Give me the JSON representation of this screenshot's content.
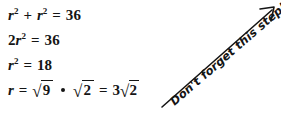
{
  "document": {
    "type": "math-worksheet-step",
    "background_color": "#ffffff",
    "text_color": "#151515"
  },
  "equations": {
    "line1": {
      "id": "eq-sum-of-squares",
      "plain": "r^2 + r^2 = 36",
      "tokens": {
        "var": "r",
        "exp": "2",
        "plus": "+",
        "equals": "=",
        "result": "36"
      }
    },
    "line2": {
      "id": "eq-combined-terms",
      "plain": "2r^2 = 36",
      "tokens": {
        "coefficient": "2",
        "var": "r",
        "exp": "2",
        "equals": "=",
        "result": "36"
      }
    },
    "line3": {
      "id": "eq-divided-by-two",
      "plain": "r^2 = 18",
      "tokens": {
        "var": "r",
        "exp": "2",
        "equals": "=",
        "result": "18"
      }
    },
    "line4": {
      "id": "eq-square-root-simplified",
      "plain": "r = sqrt(9) * sqrt(2) = 3 sqrt(2)",
      "tokens": {
        "var": "r",
        "equals": "=",
        "radicand_a": "9",
        "multiply": "•",
        "radicand_b": "2",
        "equals2": "=",
        "coefficient": "3",
        "radicand_c": "2",
        "radical_sign": "√"
      }
    }
  },
  "annotation": {
    "text": "Don't forget this step!",
    "style": "handwritten-italic",
    "rotation_degrees": -41,
    "arrow": {
      "name": "callout-arrow",
      "direction": "up-right",
      "start": [
        162,
        107
      ],
      "end": [
        275,
        8
      ],
      "color": "#151515"
    }
  }
}
